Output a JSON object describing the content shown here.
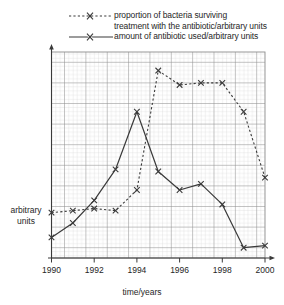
{
  "legend": {
    "position": "top",
    "entries": [
      {
        "name": "proportion-of-bacteria-surviving",
        "style": "dotted",
        "marker": "x",
        "line1": "proportion of bacteria surviving",
        "line2": "treatment with the antibiotic/arbitrary units"
      },
      {
        "name": "amount-of-antibiotic-used",
        "style": "solid",
        "marker": "x",
        "line1": "amount of antibiotic used/arbitrary units",
        "line2": ""
      }
    ]
  },
  "axes": {
    "y_label_line1": "arbitrary",
    "y_label_line2": "units",
    "x_label": "time/years",
    "x_ticks": [
      "1990",
      "1992",
      "1994",
      "1996",
      "1998",
      "2000"
    ]
  },
  "colors": {
    "ink": "#3a3a3a",
    "grid_minor": "#c9c9c9",
    "grid_major": "#8d8d8d",
    "background": "#ffffff"
  },
  "chart_data": {
    "type": "line",
    "title": "",
    "xlabel": "time/years",
    "ylabel": "arbitrary units",
    "xlim": [
      1990,
      2000
    ],
    "ylim": [
      0,
      100
    ],
    "grid": true,
    "legend_position": "top",
    "x": [
      1990,
      1991,
      1992,
      1993,
      1994,
      1995,
      1996,
      1997,
      1998,
      1999,
      2000
    ],
    "series": [
      {
        "name": "proportion of bacteria surviving treatment with the antibiotic/arbitrary units",
        "style": "dotted",
        "marker": "x",
        "values": [
          22,
          23,
          24,
          23,
          33,
          91,
          84,
          85,
          85,
          71,
          39
        ]
      },
      {
        "name": "amount of antibiotic used/arbitrary units",
        "style": "solid",
        "marker": "x",
        "values": [
          10,
          17,
          28,
          43,
          71,
          42,
          33,
          36,
          26,
          5,
          6
        ]
      }
    ]
  }
}
